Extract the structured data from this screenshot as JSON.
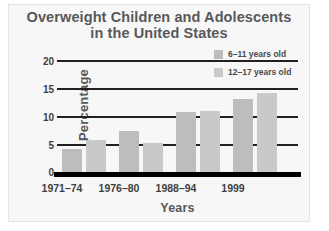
{
  "chart_data": {
    "type": "bar",
    "title": "Overweight Children and Adolescents in the United States",
    "title_line1": "Overweight Children and Adolescents",
    "title_line2": "in the United States",
    "xlabel": "Years",
    "ylabel": "Percentage",
    "categories": [
      "1971–74",
      "1976–80",
      "1988–94",
      "1999"
    ],
    "ylim": [
      0,
      20
    ],
    "yticks": [
      0,
      5,
      10,
      15,
      20
    ],
    "ytick_labels": [
      "0",
      "5",
      "10",
      "15",
      "20"
    ],
    "grid": true,
    "grid_axis": "y",
    "legend_position": "top-right",
    "series": [
      {
        "name": "6–11 years old",
        "color": "#bdbdbd",
        "values": [
          4,
          7,
          10.3,
          12.5
        ]
      },
      {
        "name": "12–17 years old",
        "color": "#c9c9c9",
        "values": [
          5.5,
          5,
          10.5,
          13.5
        ]
      }
    ]
  },
  "colors": {
    "background": "#f7f7f7",
    "axis": "#000000",
    "gridline": "#231f20",
    "title_text": "#58585a",
    "tick_text": "#3f3f41",
    "series_1": "#bdbdbd",
    "series_2": "#c9c9c9"
  }
}
